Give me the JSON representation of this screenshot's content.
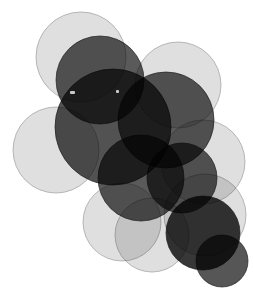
{
  "image": {
    "title": "Overlapping Translucent Circles",
    "width": 253,
    "height": 296,
    "background_color": "#ffffff",
    "blend_mode": "multiply"
  },
  "palette": {
    "light_gray": "#d9d9d9",
    "dark_gray": "#3f3f3f",
    "very_dark": "#262626",
    "near_black": "#141414",
    "stroke_light": "#9a9a9a",
    "stroke_dark": "#1f1f1f",
    "background": "#ffffff",
    "speck_color": "#c9c9c9"
  },
  "chart_data": {
    "type": "scatter",
    "xlabel": "",
    "ylabel": "",
    "xlim": [
      0,
      253
    ],
    "ylim": [
      0,
      296
    ],
    "grid": false,
    "legend": "none",
    "note": "Each data point is drawn as a large semi-transparent disc; radius encodes size, fill encodes the two-tone light/dark grouping.",
    "categories": [
      "light",
      "dark"
    ],
    "points": [
      {
        "id": "c01",
        "label": "top-left-light",
        "x": 81,
        "y": 57,
        "r": 45,
        "group": "light",
        "fill": "#d9d9d9",
        "opacity": 0.85,
        "stroke": "#9a9a9a"
      },
      {
        "id": "c02",
        "label": "top-right-light",
        "x": 178,
        "y": 85,
        "r": 43,
        "group": "light",
        "fill": "#d9d9d9",
        "opacity": 0.85,
        "stroke": "#9a9a9a"
      },
      {
        "id": "c03",
        "label": "left-mid-light",
        "x": 56,
        "y": 150,
        "r": 43,
        "group": "light",
        "fill": "#d9d9d9",
        "opacity": 0.85,
        "stroke": "#9a9a9a"
      },
      {
        "id": "c04",
        "label": "right-upper-light",
        "x": 203,
        "y": 162,
        "r": 42,
        "group": "light",
        "fill": "#d9d9d9",
        "opacity": 0.85,
        "stroke": "#9a9a9a"
      },
      {
        "id": "c05",
        "label": "right-lower-light",
        "x": 205,
        "y": 215,
        "r": 41,
        "group": "light",
        "fill": "#d9d9d9",
        "opacity": 0.85,
        "stroke": "#9a9a9a"
      },
      {
        "id": "c06",
        "label": "bottom-left-light",
        "x": 122,
        "y": 222,
        "r": 39,
        "group": "light",
        "fill": "#d9d9d9",
        "opacity": 0.85,
        "stroke": "#9a9a9a"
      },
      {
        "id": "c07",
        "label": "bottom-mid-light",
        "x": 152,
        "y": 235,
        "r": 37,
        "group": "light",
        "fill": "#d9d9d9",
        "opacity": 0.85,
        "stroke": "#9a9a9a"
      },
      {
        "id": "c08",
        "label": "upper-dark-lobe",
        "x": 100,
        "y": 80,
        "r": 44,
        "group": "dark",
        "fill": "#3f3f3f",
        "opacity": 0.86,
        "stroke": "#1f1f1f"
      },
      {
        "id": "c09",
        "label": "center-dark-core",
        "x": 113,
        "y": 127,
        "r": 58,
        "group": "dark",
        "fill": "#3f3f3f",
        "opacity": 0.9,
        "stroke": "#1f1f1f"
      },
      {
        "id": "c10",
        "label": "mid-right-dark",
        "x": 166,
        "y": 120,
        "r": 48,
        "group": "dark",
        "fill": "#3f3f3f",
        "opacity": 0.86,
        "stroke": "#1f1f1f"
      },
      {
        "id": "c11",
        "label": "mid-lower-dark",
        "x": 141,
        "y": 178,
        "r": 43,
        "group": "dark",
        "fill": "#3f3f3f",
        "opacity": 0.86,
        "stroke": "#1f1f1f"
      },
      {
        "id": "c12",
        "label": "right-dark-disc",
        "x": 182,
        "y": 178,
        "r": 35,
        "group": "dark",
        "fill": "#3f3f3f",
        "opacity": 0.86,
        "stroke": "#1f1f1f"
      },
      {
        "id": "c13",
        "label": "bottom-right-darkest",
        "x": 203,
        "y": 233,
        "r": 37,
        "group": "dark",
        "fill": "#262626",
        "opacity": 0.92,
        "stroke": "#1f1f1f"
      },
      {
        "id": "c14",
        "label": "bottom-corner-dark",
        "x": 222,
        "y": 261,
        "r": 26,
        "group": "dark",
        "fill": "#3f3f3f",
        "opacity": 0.88,
        "stroke": "#1f1f1f"
      }
    ],
    "specks": [
      {
        "id": "s1",
        "label": "speck-left",
        "x": 70,
        "y": 91,
        "w": 5,
        "h": 3
      },
      {
        "id": "s2",
        "label": "speck-right",
        "x": 116,
        "y": 90,
        "w": 3,
        "h": 3
      }
    ]
  }
}
